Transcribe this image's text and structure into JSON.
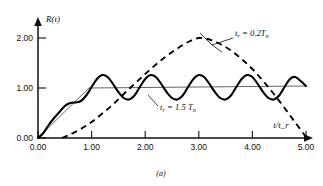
{
  "figure": {
    "caption": "(a)"
  },
  "chart_data": {
    "type": "line",
    "title": "",
    "xlabel": "t/t_r",
    "ylabel": "R(t)",
    "xlim": [
      0.0,
      5.0
    ],
    "ylim": [
      0.0,
      2.2
    ],
    "grid": false,
    "legend_position": "inline-annotations",
    "x_ticks": [
      "0.00",
      "1.00",
      "2.00",
      "3.00",
      "4.00",
      "5.00"
    ],
    "x_tick_values": [
      0.0,
      1.0,
      2.0,
      3.0,
      4.0,
      5.0
    ],
    "y_ticks": [
      "0.00",
      "1.00",
      "2.00"
    ],
    "y_tick_values": [
      0.0,
      1.0,
      2.0
    ],
    "annotations": [
      {
        "id": "annot-dashed",
        "text_main": "t",
        "text_sub1": "r",
        "text_mid": " = 0.2T",
        "text_sub2": "n",
        "full_text": "t_r = 0.2T_n",
        "x": 3.9,
        "y": 2.05
      },
      {
        "id": "annot-solid",
        "text_main": "t",
        "text_sub1": "r",
        "text_mid": " = 1.5 T",
        "text_sub2": "n",
        "full_text": "t_r = 1.5 T_n",
        "x": 2.55,
        "y": 0.72
      }
    ],
    "series": [
      {
        "name": "t_r = 0.2T_n",
        "style": "dashed",
        "comment": "half-sine shock response, peak 2.00 at t/t_r = 3.00, zero near 0.45 and 5.00",
        "x": [
          0.45,
          0.6,
          0.8,
          1.0,
          1.2,
          1.4,
          1.6,
          1.8,
          2.0,
          2.2,
          2.4,
          2.6,
          2.8,
          3.0,
          3.2,
          3.4,
          3.6,
          3.8,
          4.0,
          4.2,
          4.4,
          4.6,
          4.8,
          5.0
        ],
        "y": [
          0.0,
          0.07,
          0.18,
          0.32,
          0.49,
          0.67,
          0.88,
          1.08,
          1.28,
          1.47,
          1.64,
          1.79,
          1.92,
          2.0,
          1.97,
          1.88,
          1.75,
          1.58,
          1.38,
          1.14,
          0.88,
          0.6,
          0.31,
          0.02
        ]
      },
      {
        "name": "t_r = 1.5 T_n",
        "style": "solid",
        "comment": "ramp response with superimposed oscillation about 1.0, amplitude about 0.25, ~6 cycles over 0-5",
        "x": [
          0.0,
          0.1,
          0.2,
          0.3,
          0.4,
          0.5,
          0.6,
          0.7,
          0.8,
          0.9,
          1.0,
          1.1,
          1.2,
          1.3,
          1.4,
          1.5,
          1.6,
          1.7,
          1.8,
          1.9,
          2.0,
          2.1,
          2.2,
          2.3,
          2.4,
          2.5,
          2.6,
          2.7,
          2.8,
          2.9,
          3.0,
          3.1,
          3.2,
          3.3,
          3.4,
          3.5,
          3.6,
          3.7,
          3.8,
          3.9,
          4.0,
          4.1,
          4.2,
          4.3,
          4.4,
          4.5,
          4.6,
          4.7,
          4.8,
          4.9,
          5.0
        ],
        "y": [
          0.0,
          0.1,
          0.26,
          0.4,
          0.52,
          0.64,
          0.7,
          0.71,
          0.74,
          0.85,
          1.02,
          1.18,
          1.26,
          1.22,
          1.08,
          0.92,
          0.8,
          0.77,
          0.85,
          1.02,
          1.18,
          1.26,
          1.22,
          1.08,
          0.92,
          0.8,
          0.77,
          0.85,
          1.02,
          1.18,
          1.26,
          1.22,
          1.08,
          0.92,
          0.8,
          0.77,
          0.85,
          1.02,
          1.18,
          1.26,
          1.22,
          1.08,
          0.92,
          0.8,
          0.77,
          0.85,
          1.02,
          1.18,
          1.22,
          1.14,
          1.04
        ]
      },
      {
        "name": "reference-ramp",
        "style": "thin",
        "comment": "thin straight static-response line: ramp from origin to 1.0 then flat",
        "x": [
          0.0,
          0.95,
          5.0
        ],
        "y": [
          0.0,
          1.0,
          1.04
        ]
      }
    ]
  }
}
